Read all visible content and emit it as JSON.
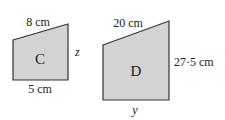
{
  "shapes": [
    {
      "id": "C",
      "label": "C",
      "top_side": "8 cm",
      "right_side": "z",
      "bottom_side": "5 cm",
      "fill": "#d3d3d3",
      "stroke": "#333333"
    },
    {
      "id": "D",
      "label": "D",
      "top_side": "20 cm",
      "right_side": "27·5 cm",
      "bottom_side": "y",
      "fill": "#d3d3d3",
      "stroke": "#333333"
    }
  ]
}
